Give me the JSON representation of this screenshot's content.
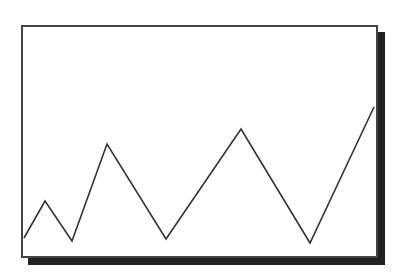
{
  "colors": {
    "frame_border": "#444444",
    "shadow": "#222222",
    "line": "#333333",
    "background": "#ffffff"
  },
  "chart_data": {
    "type": "line",
    "title": "",
    "xlabel": "",
    "ylabel": "",
    "grid": false,
    "legend": null,
    "axes_visible": false,
    "x": [
      0,
      1,
      2,
      3,
      4,
      5,
      6,
      7
    ],
    "series": [
      {
        "name": "series-1",
        "values": [
          8.6,
          24.5,
          7.3,
          48.9,
          8.2,
          55.4,
          6.4,
          64.8
        ]
      }
    ],
    "ylim": [
      0,
      100
    ],
    "pixel_points": [
      [
        24,
        238
      ],
      [
        45,
        201
      ],
      [
        72,
        241
      ],
      [
        107,
        144
      ],
      [
        166,
        239
      ],
      [
        241,
        129
      ],
      [
        310,
        243
      ],
      [
        374,
        107
      ]
    ]
  }
}
